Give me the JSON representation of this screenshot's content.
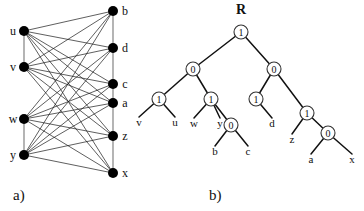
{
  "figure": {
    "panel_a": {
      "caption": "a)",
      "type": "bipartite-graph",
      "left_vertices": [
        {
          "id": "u",
          "label": "u",
          "x": 24,
          "y": 31
        },
        {
          "id": "v",
          "label": "v",
          "x": 24,
          "y": 67
        },
        {
          "id": "w",
          "label": "w",
          "x": 24,
          "y": 119
        },
        {
          "id": "y",
          "label": "y",
          "x": 24,
          "y": 155
        }
      ],
      "right_vertices": [
        {
          "id": "b",
          "label": "b",
          "x": 113,
          "y": 11
        },
        {
          "id": "d",
          "label": "d",
          "x": 113,
          "y": 48
        },
        {
          "id": "c",
          "label": "c",
          "x": 113,
          "y": 84
        },
        {
          "id": "a",
          "label": "a",
          "x": 113,
          "y": 103
        },
        {
          "id": "z",
          "label": "z",
          "x": 113,
          "y": 136
        },
        {
          "id": "x",
          "label": "x",
          "x": 113,
          "y": 173
        }
      ],
      "spine_edges": [
        [
          "u",
          "v"
        ],
        [
          "w",
          "y"
        ],
        [
          "b",
          "d"
        ],
        [
          "d",
          "c"
        ],
        [
          "c",
          "a"
        ],
        [
          "a",
          "z"
        ],
        [
          "z",
          "x"
        ]
      ],
      "cross_edges": [
        [
          "u",
          "b"
        ],
        [
          "u",
          "d"
        ],
        [
          "u",
          "c"
        ],
        [
          "u",
          "a"
        ],
        [
          "u",
          "z"
        ],
        [
          "u",
          "x"
        ],
        [
          "v",
          "b"
        ],
        [
          "v",
          "d"
        ],
        [
          "v",
          "c"
        ],
        [
          "v",
          "a"
        ],
        [
          "v",
          "z"
        ],
        [
          "v",
          "x"
        ],
        [
          "w",
          "b"
        ],
        [
          "w",
          "d"
        ],
        [
          "w",
          "c"
        ],
        [
          "w",
          "a"
        ],
        [
          "w",
          "z"
        ],
        [
          "w",
          "x"
        ],
        [
          "y",
          "b"
        ],
        [
          "y",
          "d"
        ],
        [
          "y",
          "c"
        ],
        [
          "y",
          "a"
        ],
        [
          "y",
          "z"
        ],
        [
          "y",
          "x"
        ]
      ],
      "node_radius": 5,
      "node_color": "#000000",
      "edge_color": "#1a1a1a"
    },
    "panel_b": {
      "caption": "b)",
      "type": "binary-tree",
      "root_label": "R",
      "root_label_pos": {
        "x": 241,
        "y": 14
      },
      "internal_nodes": [
        {
          "id": "n0",
          "value": "1",
          "x": 241,
          "y": 32
        },
        {
          "id": "n1",
          "value": "0",
          "x": 193,
          "y": 69
        },
        {
          "id": "n2",
          "value": "0",
          "x": 274,
          "y": 69
        },
        {
          "id": "n3",
          "value": "1",
          "x": 159,
          "y": 99
        },
        {
          "id": "n4",
          "value": "1",
          "x": 211,
          "y": 99
        },
        {
          "id": "n5",
          "value": "1",
          "x": 256,
          "y": 99
        },
        {
          "id": "n6",
          "value": "1",
          "x": 307,
          "y": 113
        },
        {
          "id": "n7",
          "value": "0",
          "x": 231,
          "y": 125
        },
        {
          "id": "n8",
          "value": "0",
          "x": 328,
          "y": 133
        }
      ],
      "leaves": [
        {
          "id": "lv",
          "label": "v",
          "x": 139,
          "y": 126,
          "parent": "n3"
        },
        {
          "id": "lu",
          "label": "u",
          "x": 175,
          "y": 126,
          "parent": "n3"
        },
        {
          "id": "lw",
          "label": "w",
          "x": 194,
          "y": 127,
          "parent": "n4"
        },
        {
          "id": "ly",
          "label": "y",
          "x": 220,
          "y": 127,
          "parent": "n4"
        },
        {
          "id": "lb",
          "label": "b",
          "x": 215,
          "y": 155,
          "parent": "n7"
        },
        {
          "id": "lc",
          "label": "c",
          "x": 248,
          "y": 155,
          "parent": "n7"
        },
        {
          "id": "ld",
          "label": "d",
          "x": 272,
          "y": 127,
          "parent": "n5"
        },
        {
          "id": "lz",
          "label": "z",
          "x": 292,
          "y": 143,
          "parent": "n6"
        },
        {
          "id": "la",
          "label": "a",
          "x": 311,
          "y": 163,
          "parent": "n8"
        },
        {
          "id": "lx",
          "label": "x",
          "x": 352,
          "y": 163,
          "parent": "n8"
        }
      ],
      "tree_edges": [
        [
          "n0",
          "n1"
        ],
        [
          "n0",
          "n2"
        ],
        [
          "n1",
          "n3"
        ],
        [
          "n1",
          "n4"
        ],
        [
          "n2",
          "n5"
        ],
        [
          "n2",
          "n6"
        ],
        [
          "n4",
          "n7"
        ],
        [
          "n6",
          "n8"
        ]
      ],
      "node_radius": 7,
      "node_fill": "#ffffff",
      "node_stroke": "#333333",
      "edge_color": "#111111"
    }
  }
}
